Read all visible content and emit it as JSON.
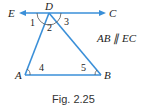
{
  "diagram": {
    "points": {
      "D": {
        "label": "D"
      },
      "E": {
        "label": "E"
      },
      "C": {
        "label": "C"
      },
      "A": {
        "label": "A"
      },
      "B": {
        "label": "B"
      }
    },
    "angles": [
      "1",
      "2",
      "3",
      "4",
      "5"
    ],
    "note": "AB ∥ EC",
    "caption": "Fig. 2.25",
    "colors": {
      "line": "#3a8fd8",
      "text": "#222222"
    }
  }
}
